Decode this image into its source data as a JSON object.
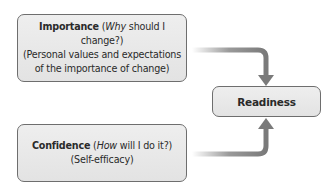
{
  "diagram": {
    "importance": {
      "title": "Importance",
      "question_open": " (",
      "question_italic": "Why",
      "question_rest": " should I change?)",
      "line2": "(Personal values and expectations",
      "line3": "of the importance of change)"
    },
    "confidence": {
      "title": "Confidence",
      "question_open": " (",
      "question_italic": "How",
      "question_rest": " will I do it?)",
      "line2": "(Self-efficacy)"
    },
    "readiness": {
      "title": "Readiness"
    },
    "colors": {
      "box_fill": "#e8e8e8",
      "box_border": "#6e6e6e",
      "arrow": "#808080",
      "text": "#2a2a2a"
    }
  }
}
